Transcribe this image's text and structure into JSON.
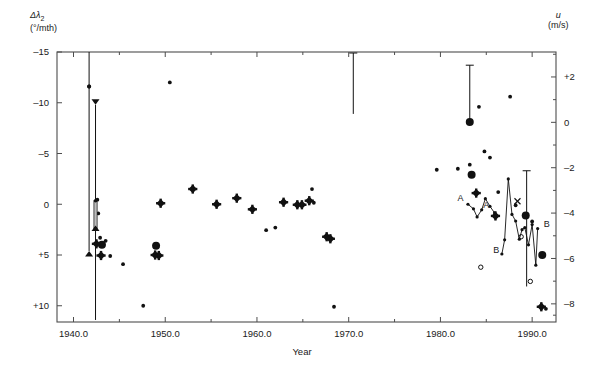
{
  "figure": {
    "axis_left_label": "Δλ",
    "axis_left_sub": "2",
    "axis_left_units": "(°/mth)",
    "axis_right_label": "u",
    "axis_right_units": "(m/s)",
    "axis_x_label": "Year",
    "frame_color": "#4d4d4d",
    "marker_color": "#111111"
  },
  "chart_data": {
    "type": "scatter",
    "title": "",
    "xlabel": "Year",
    "ylabel": "Δλ2 (°/mth)",
    "ylabel_right": "u (m/s)",
    "xlim": [
      1938.2,
      1992.6
    ],
    "ylim": [
      -15,
      11.6
    ],
    "y_inverted": true,
    "ylim_right": [
      3.1,
      -8.8
    ],
    "grid": false,
    "legend": "none",
    "xticks": [
      1940.0,
      1950.0,
      1960.0,
      1970.0,
      1980.0,
      1990.0
    ],
    "xticklabels": [
      "1940.0",
      "1950.0",
      "1960.0",
      "1970.0",
      "1980.0",
      "1990.0"
    ],
    "xminorticks": [
      1945,
      1955,
      1965,
      1975,
      1985
    ],
    "yticks_left": [
      -15,
      -10,
      -5,
      0,
      5,
      10
    ],
    "yticklabels_left": [
      "–15",
      "–10",
      "–5",
      "0",
      "+5",
      "+10"
    ],
    "yticks_right": [
      2,
      0,
      -2,
      -4,
      -6,
      -8
    ],
    "yticklabels_right": [
      "+2",
      "0",
      "–2",
      "–4",
      "–6",
      "–8"
    ],
    "yminorticks_right": [
      3,
      1,
      -1,
      -3,
      -5,
      -7,
      -8.5
    ],
    "series": [
      {
        "name": "crosshair-diamond",
        "marker": "diamond-cross",
        "points": [
          [
            1942.5,
            3.9
          ],
          [
            1943.0,
            5.05
          ],
          [
            1948.9,
            5.0
          ],
          [
            1949.3,
            5.05
          ],
          [
            1949.5,
            -0.1
          ],
          [
            1953.0,
            -1.5
          ],
          [
            1955.6,
            0.0
          ],
          [
            1957.8,
            -0.6
          ],
          [
            1959.5,
            0.5
          ],
          [
            1962.9,
            -0.2
          ],
          [
            1964.4,
            0.05
          ],
          [
            1964.9,
            0.05
          ],
          [
            1965.7,
            -0.35
          ],
          [
            1967.6,
            3.2
          ],
          [
            1968.0,
            3.4
          ],
          [
            1983.9,
            -1.1
          ],
          [
            1986.0,
            1.15
          ],
          [
            1991.0,
            10.1
          ]
        ]
      },
      {
        "name": "small-dots",
        "marker": "dot-small",
        "points": [
          [
            1941.7,
            -11.6
          ],
          [
            1942.6,
            -0.45
          ],
          [
            1942.7,
            0.9
          ],
          [
            1942.9,
            3.3
          ],
          [
            1943.5,
            3.6
          ],
          [
            1944.0,
            5.1
          ],
          [
            1945.4,
            5.9
          ],
          [
            1947.6,
            10.0
          ],
          [
            1950.5,
            -12.0
          ],
          [
            1961.0,
            2.55
          ],
          [
            1962.0,
            2.3
          ],
          [
            1966.0,
            -1.5
          ],
          [
            1966.2,
            -0.15
          ],
          [
            1968.4,
            10.1
          ],
          [
            1979.6,
            -3.4
          ],
          [
            1981.9,
            -3.5
          ],
          [
            1983.2,
            -3.9
          ],
          [
            1984.2,
            -9.6
          ],
          [
            1984.8,
            -5.2
          ],
          [
            1985.4,
            -4.6
          ],
          [
            1986.3,
            -1.2
          ],
          [
            1987.6,
            -10.6
          ],
          [
            1988.2,
            0.1
          ],
          [
            1990.0,
            1.7
          ],
          [
            1991.5,
            10.3
          ]
        ]
      },
      {
        "name": "large-dots",
        "marker": "dot-large",
        "points": [
          [
            1943.1,
            4.0
          ],
          [
            1949.0,
            4.1
          ],
          [
            1983.2,
            -8.1
          ],
          [
            1983.4,
            -2.9
          ],
          [
            1989.3,
            1.1
          ],
          [
            1991.1,
            5.0
          ]
        ]
      },
      {
        "name": "open-circles",
        "marker": "circle-open",
        "points": [
          [
            1984.4,
            6.2
          ],
          [
            1988.8,
            3.2
          ],
          [
            1989.8,
            7.6
          ]
        ]
      },
      {
        "name": "cross-x",
        "marker": "x",
        "points": [
          [
            1988.4,
            -0.3
          ]
        ]
      },
      {
        "name": "arrow-bar-1941",
        "marker": "errorbar-arrow",
        "x": 1941.7,
        "y_top": -15.0,
        "y_bottom": 4.6,
        "value": -11.6,
        "arrow_bottom": true
      },
      {
        "name": "arrow-bar-1942",
        "marker": "errorbar-arrow",
        "x": 1942.4,
        "y_top": -9.8,
        "y_bottom": 11.4,
        "arrow_top": true,
        "inner_bar_top": -0.35,
        "inner_bar_bottom": 2.4
      },
      {
        "name": "errorbar-1970",
        "marker": "errorbar",
        "x": 1970.5,
        "y_top": -14.9,
        "y_bottom": -8.9
      },
      {
        "name": "errorbar-1983",
        "marker": "errorbar",
        "x": 1983.2,
        "y_top": -13.7,
        "y_bottom": -8.1
      },
      {
        "name": "errorbar-1989",
        "marker": "errorbar",
        "x": 1989.4,
        "y_top": -3.3,
        "y_bottom": 8.1
      },
      {
        "name": "curve-A",
        "marker": "polyline",
        "label": "A",
        "label_positions": [
          [
            1982.2,
            -0.3
          ],
          [
            1985.0,
            0.4
          ]
        ],
        "points": [
          [
            1983.0,
            0.0
          ],
          [
            1983.6,
            0.45
          ],
          [
            1984.0,
            1.25
          ],
          [
            1984.5,
            0.55
          ],
          [
            1984.9,
            -0.55
          ],
          [
            1985.4,
            0.2
          ],
          [
            1985.9,
            0.85
          ]
        ]
      },
      {
        "name": "curve-B",
        "marker": "polyline",
        "label": "B",
        "label_positions": [
          [
            1986.1,
            4.8
          ],
          [
            1991.6,
            2.2
          ]
        ],
        "points": [
          [
            1986.7,
            4.9
          ],
          [
            1987.0,
            3.5
          ],
          [
            1987.4,
            -2.5
          ],
          [
            1987.8,
            1.0
          ],
          [
            1988.2,
            1.65
          ],
          [
            1988.6,
            3.45
          ],
          [
            1988.9,
            2.5
          ],
          [
            1989.2,
            2.3
          ],
          [
            1989.6,
            4.0
          ],
          [
            1990.0,
            2.0
          ],
          [
            1990.4,
            6.0
          ],
          [
            1990.6,
            2.4
          ]
        ]
      }
    ]
  }
}
